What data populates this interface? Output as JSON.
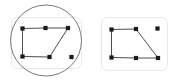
{
  "figure": {
    "title": "",
    "background_color": "#ffffff",
    "width": 181,
    "height": 84,
    "panel_count": 2
  },
  "style": {
    "panel_fill": "#ffffff",
    "panel_border": "#e8e8e8",
    "panel_radius": 6,
    "node_color": "#1a1a1a",
    "node_size": 2.1,
    "edge_color": "#4d4d4d",
    "edge_width": 1.0,
    "circle_color": "#6b6b6b",
    "circle_width": 0.9
  },
  "panels": [
    {
      "id": "left-panel",
      "name": "graph-panel-with-circle",
      "rect": {
        "x": 11,
        "y": 17,
        "w": 70,
        "h": 51
      },
      "has_circle": true,
      "circle": {
        "cx": 46,
        "cy": 40.5,
        "r": 35.5
      },
      "nodes": [
        {
          "id": "n1",
          "label": "",
          "x": 22.5,
          "y": 28.5,
          "isolated": false
        },
        {
          "id": "n2",
          "label": "",
          "x": 45.5,
          "y": 28.0,
          "isolated": false
        },
        {
          "id": "n3",
          "label": "",
          "x": 68.0,
          "y": 28.0,
          "isolated": false
        },
        {
          "id": "n4",
          "label": "",
          "x": 22.5,
          "y": 56.5,
          "isolated": false
        },
        {
          "id": "n5",
          "label": "",
          "x": 49.5,
          "y": 57.0,
          "isolated": false
        },
        {
          "id": "n6",
          "label": "",
          "x": 71.5,
          "y": 57.0,
          "isolated": true
        }
      ],
      "edges": [
        {
          "source": "n1",
          "target": "n2"
        },
        {
          "source": "n2",
          "target": "n3"
        },
        {
          "source": "n1",
          "target": "n4"
        },
        {
          "source": "n4",
          "target": "n5"
        },
        {
          "source": "n3",
          "target": "n5"
        }
      ]
    },
    {
      "id": "right-panel",
      "name": "graph-panel-plain",
      "rect": {
        "x": 101,
        "y": 17,
        "w": 66,
        "h": 53
      },
      "has_circle": false,
      "circle": null,
      "nodes": [
        {
          "id": "m1",
          "label": "",
          "x": 111.5,
          "y": 29.5,
          "isolated": false
        },
        {
          "id": "m2",
          "label": "",
          "x": 136.0,
          "y": 29.0,
          "isolated": false
        },
        {
          "id": "m3",
          "label": "",
          "x": 157.5,
          "y": 28.5,
          "isolated": true
        },
        {
          "id": "m4",
          "label": "",
          "x": 111.5,
          "y": 57.5,
          "isolated": false
        },
        {
          "id": "m5",
          "label": "",
          "x": 136.0,
          "y": 58.0,
          "isolated": false
        },
        {
          "id": "m6",
          "label": "",
          "x": 158.0,
          "y": 58.0,
          "isolated": false
        }
      ],
      "edges": [
        {
          "source": "m1",
          "target": "m2"
        },
        {
          "source": "m1",
          "target": "m4"
        },
        {
          "source": "m4",
          "target": "m5"
        },
        {
          "source": "m5",
          "target": "m6"
        },
        {
          "source": "m2",
          "target": "m6"
        }
      ]
    }
  ]
}
